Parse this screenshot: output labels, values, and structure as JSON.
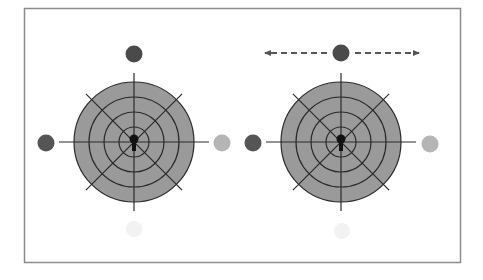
{
  "diagram": {
    "frame": {
      "x": 24,
      "y": 8,
      "width": 436,
      "height": 254,
      "stroke": "#8c8c8c"
    },
    "colors": {
      "target_fill": "#9a9a9a",
      "line": "#2a2a2a",
      "dot_dark": "#555555",
      "dot_light": "#b5b5b5",
      "dot_top": "#4a4a4a",
      "ghost": "#f2f2f2",
      "arrow": "#555555"
    },
    "panels": [
      {
        "name": "left",
        "center": [
          134,
          142
        ],
        "rings": [
          60,
          45,
          30,
          15
        ],
        "dots": {
          "top": [
            134,
            54
          ],
          "left": [
            46,
            143
          ],
          "right": [
            222,
            143
          ],
          "ghost": [
            134,
            229
          ]
        },
        "arrows": false
      },
      {
        "name": "right",
        "center": [
          341,
          142
        ],
        "rings": [
          60,
          45,
          30,
          15
        ],
        "dots": {
          "top": [
            341,
            53
          ],
          "left": [
            253,
            143
          ],
          "right": [
            430,
            144
          ],
          "ghost": [
            342,
            231
          ]
        },
        "arrows": true
      }
    ]
  }
}
